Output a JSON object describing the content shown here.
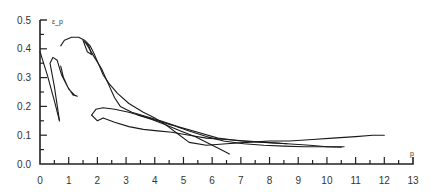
{
  "chart_data": {
    "type": "line",
    "title": "",
    "xlabel": "p",
    "ylabel": "ε_p",
    "xlim": [
      0,
      13
    ],
    "ylim": [
      0,
      0.5
    ],
    "grid": false,
    "legend": null,
    "x_ticks": [
      "0",
      "1",
      "2",
      "3",
      "4",
      "5",
      "6",
      "7",
      "8",
      "9",
      "10",
      "11",
      "12",
      "13"
    ],
    "y_ticks": [
      "0.0",
      "0.1",
      "0.2",
      "0.3",
      "0.4",
      "0.5"
    ],
    "series": [
      {
        "name": "curve-1",
        "points": [
          [
            0.0,
            0.39
          ],
          [
            0.25,
            0.31
          ],
          [
            0.5,
            0.22
          ],
          [
            0.68,
            0.15
          ]
        ]
      },
      {
        "name": "curve-2",
        "points": [
          [
            0.68,
            0.15
          ],
          [
            0.5,
            0.27
          ],
          [
            0.35,
            0.35
          ],
          [
            0.45,
            0.37
          ],
          [
            0.6,
            0.36
          ],
          [
            0.75,
            0.31
          ],
          [
            0.95,
            0.27
          ],
          [
            1.15,
            0.24
          ],
          [
            1.3,
            0.235
          ],
          [
            1.2,
            0.24
          ],
          [
            1.0,
            0.26
          ],
          [
            0.82,
            0.3
          ],
          [
            0.72,
            0.34
          ]
        ]
      },
      {
        "name": "curve-3",
        "points": [
          [
            0.72,
            0.41
          ],
          [
            0.85,
            0.43
          ],
          [
            1.1,
            0.44
          ],
          [
            1.35,
            0.44
          ],
          [
            1.55,
            0.43
          ],
          [
            1.75,
            0.41
          ],
          [
            1.9,
            0.38
          ],
          [
            2.05,
            0.345
          ],
          [
            2.2,
            0.31
          ],
          [
            2.4,
            0.28
          ],
          [
            2.7,
            0.245
          ],
          [
            3.1,
            0.21
          ],
          [
            3.6,
            0.18
          ],
          [
            4.0,
            0.16
          ],
          [
            4.4,
            0.135
          ],
          [
            4.8,
            0.105
          ],
          [
            5.2,
            0.075
          ],
          [
            5.8,
            0.065
          ],
          [
            6.5,
            0.07
          ],
          [
            7.2,
            0.075
          ],
          [
            8.0,
            0.08
          ],
          [
            8.7,
            0.08
          ],
          [
            9.5,
            0.085
          ],
          [
            10.2,
            0.09
          ],
          [
            11.0,
            0.095
          ],
          [
            11.6,
            0.1
          ],
          [
            12.0,
            0.1
          ]
        ]
      },
      {
        "name": "curve-4",
        "points": [
          [
            1.5,
            0.43
          ],
          [
            1.65,
            0.39
          ],
          [
            1.8,
            0.38
          ],
          [
            1.7,
            0.41
          ],
          [
            1.55,
            0.425
          ]
        ]
      },
      {
        "name": "curve-5",
        "points": [
          [
            1.6,
            0.42
          ],
          [
            1.9,
            0.37
          ],
          [
            2.15,
            0.33
          ],
          [
            2.35,
            0.285
          ],
          [
            2.6,
            0.23
          ],
          [
            2.8,
            0.2
          ],
          [
            3.2,
            0.18
          ],
          [
            3.7,
            0.165
          ],
          [
            4.2,
            0.15
          ],
          [
            4.8,
            0.13
          ],
          [
            5.5,
            0.11
          ],
          [
            6.2,
            0.09
          ],
          [
            7.0,
            0.08
          ],
          [
            7.8,
            0.075
          ],
          [
            8.6,
            0.07
          ],
          [
            9.4,
            0.065
          ],
          [
            10.0,
            0.06
          ],
          [
            10.6,
            0.06
          ]
        ]
      },
      {
        "name": "curve-6",
        "points": [
          [
            1.8,
            0.17
          ],
          [
            1.95,
            0.19
          ],
          [
            2.2,
            0.195
          ],
          [
            2.6,
            0.19
          ],
          [
            3.1,
            0.18
          ],
          [
            3.6,
            0.165
          ],
          [
            4.1,
            0.15
          ],
          [
            4.6,
            0.135
          ],
          [
            5.2,
            0.115
          ],
          [
            5.8,
            0.095
          ],
          [
            6.4,
            0.08
          ],
          [
            7.1,
            0.07
          ],
          [
            7.8,
            0.065
          ],
          [
            8.5,
            0.062
          ],
          [
            9.2,
            0.06
          ],
          [
            9.9,
            0.06
          ],
          [
            10.5,
            0.058
          ]
        ]
      },
      {
        "name": "curve-7",
        "points": [
          [
            1.8,
            0.17
          ],
          [
            2.0,
            0.15
          ],
          [
            2.2,
            0.16
          ],
          [
            2.6,
            0.145
          ],
          [
            3.1,
            0.13
          ],
          [
            3.6,
            0.12
          ],
          [
            4.1,
            0.115
          ],
          [
            4.6,
            0.11
          ],
          [
            5.2,
            0.1
          ],
          [
            5.8,
            0.09
          ],
          [
            6.5,
            0.085
          ],
          [
            7.2,
            0.08
          ],
          [
            7.9,
            0.075
          ],
          [
            8.6,
            0.07
          ]
        ]
      },
      {
        "name": "curve-8",
        "points": [
          [
            3.4,
            0.17
          ],
          [
            3.9,
            0.155
          ],
          [
            4.4,
            0.135
          ],
          [
            4.9,
            0.115
          ],
          [
            5.4,
            0.095
          ],
          [
            5.9,
            0.07
          ],
          [
            6.3,
            0.05
          ],
          [
            6.6,
            0.035
          ]
        ]
      }
    ]
  }
}
